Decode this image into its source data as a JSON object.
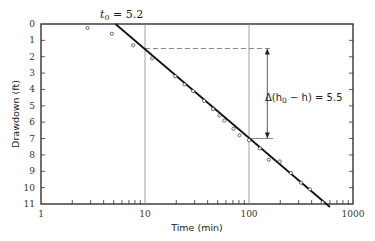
{
  "chart_data": {
    "type": "scatter",
    "title": "",
    "xlabel": "Time (min)",
    "ylabel": "Drawdown (ft)",
    "xscale": "log",
    "xlim": [
      1,
      1000
    ],
    "ylim": [
      11,
      0
    ],
    "y_inverted": true,
    "grid": false,
    "x_tick_labels": [
      "1",
      "10",
      "100",
      "1000"
    ],
    "y_tick_labels": [
      "0",
      "1",
      "2",
      "3",
      "4",
      "5",
      "6",
      "7",
      "8",
      "9",
      "10",
      "11"
    ],
    "series": [
      {
        "name": "Observed drawdown",
        "marker": "open-circle",
        "x": [
          2.8,
          4.8,
          7.7,
          11.7,
          19.5,
          24,
          29,
          37,
          45,
          52,
          58,
          71,
          81,
          100,
          127,
          155,
          198,
          253,
          316,
          385,
          510
        ],
        "y": [
          0.25,
          0.6,
          1.3,
          2.1,
          3.2,
          3.7,
          4.1,
          4.7,
          5.2,
          5.6,
          5.9,
          6.4,
          6.8,
          7.1,
          7.6,
          8.3,
          8.4,
          9.1,
          9.7,
          10.1,
          10.9
        ]
      },
      {
        "name": "Fitted straight line",
        "type": "line",
        "x": [
          5.2,
          600
        ],
        "y": [
          0,
          11.3
        ]
      }
    ],
    "reference_lines": [
      {
        "type": "vertical",
        "x": 10
      },
      {
        "type": "vertical",
        "x": 100
      },
      {
        "type": "horizontal-dashed",
        "y": 1.5,
        "x_from": 10,
        "x_to": 170
      },
      {
        "type": "horizontal-dashed",
        "y": 7.0,
        "x_from": 100,
        "x_to": 170
      }
    ],
    "annotations": [
      {
        "text": "t0 = 5.2",
        "display_main": "t",
        "display_sub": "0",
        "display_rest": " = 5.2",
        "x": 5.2,
        "y": 0,
        "position": "above-axis"
      },
      {
        "text": "Δ(h0 − h) = 5.5",
        "display_pre": "Δ(h",
        "display_sub": "0",
        "display_rest": " − h) = 5.5",
        "arrow_from_y": 1.5,
        "arrow_to_y": 7.0,
        "x": 150
      }
    ]
  },
  "labels": {
    "xlabel": "Time (min)",
    "ylabel": "Drawdown (ft)",
    "t0_main": "t",
    "t0_sub": "0",
    "t0_rest": " = 5.2",
    "delta_pre": "Δ(h",
    "delta_sub": "0",
    "delta_rest": " − h) = 5.5"
  }
}
